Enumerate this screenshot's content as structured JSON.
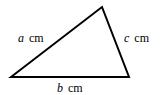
{
  "diagram": {
    "type": "triangle",
    "vertices": {
      "bottom_left": [
        11,
        77
      ],
      "top": [
        102,
        7
      ],
      "bottom_right": [
        129,
        77
      ]
    },
    "stroke_color": "#000000",
    "sides": [
      {
        "name": "a",
        "variable": "a",
        "unit": "cm",
        "position": "left"
      },
      {
        "name": "b",
        "variable": "b",
        "unit": "cm",
        "position": "bottom"
      },
      {
        "name": "c",
        "variable": "c",
        "unit": "cm",
        "position": "right"
      }
    ]
  }
}
